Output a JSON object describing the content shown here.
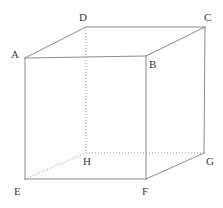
{
  "figure": {
    "name": "cube-diagram",
    "type": "geometric-solid",
    "shape": "cube",
    "width": 223,
    "height": 208,
    "background_color": "#ffffff",
    "edge_color": "#8c8c8c",
    "hidden_edge_color": "#9a9a9a",
    "label_color": "#3a3a3a",
    "edge_width": 1,
    "hidden_edge_dash": "1,2"
  },
  "vertices": [
    {
      "id": "A",
      "label": "A",
      "x": 25,
      "y": 58,
      "label_x": 11,
      "label_y": 49,
      "hidden": false
    },
    {
      "id": "B",
      "label": "B",
      "x": 146,
      "y": 56,
      "label_x": 149,
      "label_y": 59,
      "hidden": false
    },
    {
      "id": "C",
      "label": "C",
      "x": 205,
      "y": 27,
      "label_x": 204,
      "label_y": 12,
      "hidden": false
    },
    {
      "id": "D",
      "label": "D",
      "x": 86,
      "y": 27,
      "label_x": 79,
      "label_y": 12,
      "hidden": false
    },
    {
      "id": "E",
      "label": "E",
      "x": 25,
      "y": 179,
      "label_x": 14,
      "label_y": 186,
      "hidden": false
    },
    {
      "id": "F",
      "label": "F",
      "x": 146,
      "y": 179,
      "label_x": 142,
      "label_y": 186,
      "hidden": false
    },
    {
      "id": "G",
      "label": "G",
      "x": 204,
      "y": 153,
      "label_x": 206,
      "label_y": 156,
      "hidden": false
    },
    {
      "id": "H",
      "label": "H",
      "x": 86,
      "y": 153,
      "label_x": 83,
      "label_y": 156,
      "hidden": true
    }
  ],
  "edges": [
    {
      "from": "A",
      "to": "B",
      "style": "solid",
      "name": "edge-A-B"
    },
    {
      "from": "B",
      "to": "C",
      "style": "solid",
      "name": "edge-B-C"
    },
    {
      "from": "C",
      "to": "D",
      "style": "solid",
      "name": "edge-C-D"
    },
    {
      "from": "D",
      "to": "A",
      "style": "solid",
      "name": "edge-D-A"
    },
    {
      "from": "A",
      "to": "E",
      "style": "solid",
      "name": "edge-A-E"
    },
    {
      "from": "B",
      "to": "F",
      "style": "solid",
      "name": "edge-B-F"
    },
    {
      "from": "C",
      "to": "G",
      "style": "solid",
      "name": "edge-C-G"
    },
    {
      "from": "E",
      "to": "F",
      "style": "solid",
      "name": "edge-E-F"
    },
    {
      "from": "F",
      "to": "G",
      "style": "solid",
      "name": "edge-F-G"
    },
    {
      "from": "D",
      "to": "H",
      "style": "dotted",
      "name": "edge-D-H"
    },
    {
      "from": "E",
      "to": "H",
      "style": "dotted",
      "name": "edge-E-H"
    },
    {
      "from": "H",
      "to": "G",
      "style": "dotted",
      "name": "edge-H-G"
    }
  ]
}
